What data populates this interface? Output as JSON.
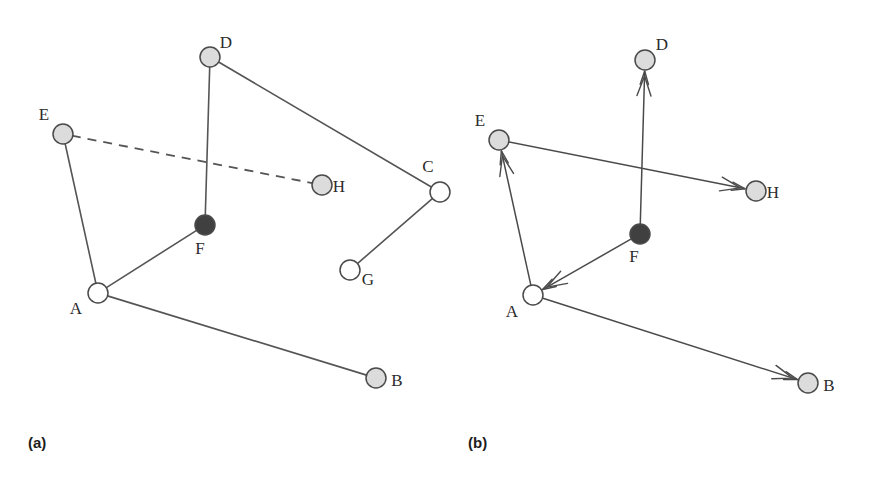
{
  "figure": {
    "caption_a": "(a)",
    "caption_b": "(b)",
    "background_color": "#ffffff",
    "edge_color": "#555555",
    "arrow_color": "#4a4a4a",
    "node_stroke_color": "#4a4a4a",
    "fill_gray": "#dcdcdc",
    "fill_white": "#ffffff",
    "fill_dark": "#404040",
    "node_radius": 10
  },
  "panel_a": {
    "id": "panel-a",
    "caption": "(a)",
    "caption_pos": {
      "x": 28,
      "y": 448
    },
    "nodes": [
      {
        "id": "A",
        "label": "A",
        "x": 98,
        "y": 293,
        "fill": "white",
        "label_x": 76,
        "label_y": 314
      },
      {
        "id": "B",
        "label": "B",
        "x": 376,
        "y": 378,
        "fill": "gray",
        "label_x": 397,
        "label_y": 386
      },
      {
        "id": "C",
        "label": "C",
        "x": 440,
        "y": 192,
        "fill": "white",
        "label_x": 428,
        "label_y": 172
      },
      {
        "id": "D",
        "label": "D",
        "x": 210,
        "y": 57,
        "fill": "gray",
        "label_x": 226,
        "label_y": 48
      },
      {
        "id": "E",
        "label": "E",
        "x": 63,
        "y": 134,
        "fill": "gray",
        "label_x": 44,
        "label_y": 120
      },
      {
        "id": "F",
        "label": "F",
        "x": 205,
        "y": 225,
        "fill": "dark",
        "label_x": 200,
        "label_y": 254
      },
      {
        "id": "G",
        "label": "G",
        "x": 350,
        "y": 270,
        "fill": "white",
        "label_x": 368,
        "label_y": 285
      },
      {
        "id": "H",
        "label": "H",
        "x": 322,
        "y": 185,
        "fill": "gray",
        "label_x": 339,
        "label_y": 192
      }
    ],
    "edges": [
      {
        "from": "D",
        "to": "F",
        "style": "solid"
      },
      {
        "from": "D",
        "to": "C",
        "style": "solid"
      },
      {
        "from": "C",
        "to": "G",
        "style": "solid"
      },
      {
        "from": "E",
        "to": "A",
        "style": "solid"
      },
      {
        "from": "A",
        "to": "F",
        "style": "solid"
      },
      {
        "from": "A",
        "to": "B",
        "style": "solid"
      },
      {
        "from": "E",
        "to": "H",
        "style": "dashed"
      }
    ]
  },
  "panel_b": {
    "id": "panel-b",
    "caption": "(b)",
    "caption_pos": {
      "x": 468,
      "y": 448
    },
    "nodes": [
      {
        "id": "A",
        "label": "A",
        "x": 533,
        "y": 295,
        "fill": "white",
        "label_x": 512,
        "label_y": 317
      },
      {
        "id": "B",
        "label": "B",
        "x": 808,
        "y": 383,
        "fill": "gray",
        "label_x": 829,
        "label_y": 391
      },
      {
        "id": "D",
        "label": "D",
        "x": 645,
        "y": 60,
        "fill": "gray",
        "label_x": 662,
        "label_y": 50
      },
      {
        "id": "E",
        "label": "E",
        "x": 499,
        "y": 140,
        "fill": "gray",
        "label_x": 480,
        "label_y": 126
      },
      {
        "id": "F",
        "label": "F",
        "x": 640,
        "y": 234,
        "fill": "dark",
        "label_x": 634,
        "label_y": 262
      },
      {
        "id": "H",
        "label": "H",
        "x": 756,
        "y": 191,
        "fill": "gray",
        "label_x": 773,
        "label_y": 198
      }
    ],
    "arrows": [
      {
        "from": "F",
        "to": "D",
        "label": "arrow-f-to-d"
      },
      {
        "from": "E",
        "to": "H",
        "label": "arrow-e-to-h"
      },
      {
        "from": "A",
        "to": "E",
        "label": "arrow-a-to-e"
      },
      {
        "from": "F",
        "to": "A",
        "label": "arrow-f-to-a"
      },
      {
        "from": "A",
        "to": "B",
        "label": "arrow-a-to-b"
      }
    ]
  }
}
